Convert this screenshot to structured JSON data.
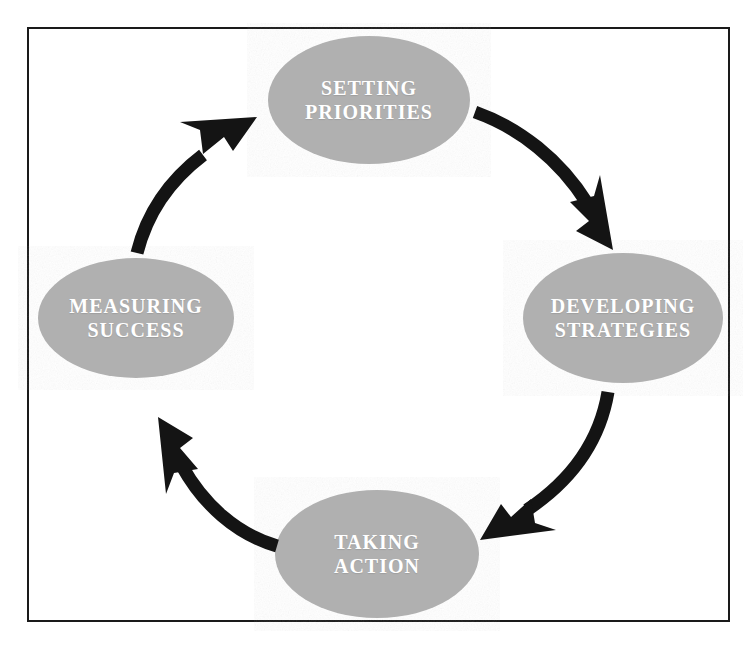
{
  "diagram": {
    "type": "cycle",
    "title": "",
    "direction": "clockwise",
    "frame": {
      "border_color": "#1a1a1a",
      "background": "#ffffff"
    },
    "node_fill": "#b0b0b0",
    "node_text_color": "#ffffff",
    "arrow_color": "#141414",
    "nodes": [
      {
        "id": "setting-priorities",
        "position": "top",
        "line1": "SETTING",
        "line2": "PRIORITIES",
        "cx": 369,
        "cy": 100,
        "rx": 101,
        "ry": 64
      },
      {
        "id": "developing-strategies",
        "position": "right",
        "line1": "DEVELOPING",
        "line2": "STRATEGIES",
        "cx": 623,
        "cy": 318,
        "rx": 100,
        "ry": 65
      },
      {
        "id": "taking-action",
        "position": "bottom",
        "line1": "TAKING",
        "line2": "ACTION",
        "cx": 377,
        "cy": 554,
        "rx": 102,
        "ry": 64
      },
      {
        "id": "measuring-success",
        "position": "left",
        "line1": "MEASURING",
        "line2": "SUCCESS",
        "cx": 136,
        "cy": 318,
        "rx": 98,
        "ry": 60
      }
    ],
    "arrows": [
      {
        "id": "arrow-priorities-to-strategies",
        "from": "setting-priorities",
        "to": "developing-strategies",
        "icon": "curved-arrow-icon"
      },
      {
        "id": "arrow-strategies-to-action",
        "from": "developing-strategies",
        "to": "taking-action",
        "icon": "curved-arrow-icon"
      },
      {
        "id": "arrow-action-to-measuring",
        "from": "taking-action",
        "to": "measuring-success",
        "icon": "curved-arrow-icon"
      },
      {
        "id": "arrow-measuring-to-priorities",
        "from": "measuring-success",
        "to": "setting-priorities",
        "icon": "curved-arrow-icon"
      }
    ]
  }
}
